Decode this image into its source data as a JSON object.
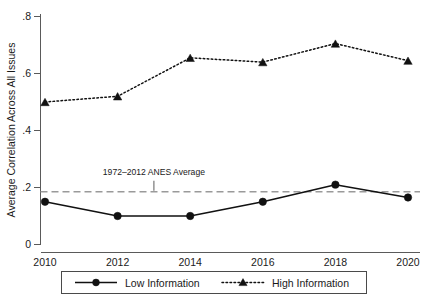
{
  "chart_data": {
    "type": "line",
    "title": "",
    "xlabel": "",
    "ylabel": "Average Correlation Across All Issues",
    "x": [
      2010,
      2012,
      2014,
      2016,
      2018,
      2020
    ],
    "xticklabels": [
      "2010",
      "2012",
      "2014",
      "2016",
      "2018",
      "2020"
    ],
    "xlim": [
      2009.5,
      2020.5
    ],
    "yticks": [
      0,
      0.2,
      0.4,
      0.6,
      0.8
    ],
    "yticklabels": [
      "0",
      ".2",
      ".4",
      ".6",
      ".8"
    ],
    "ylim": [
      0,
      0.8
    ],
    "grid": false,
    "legend_position": "bottom",
    "series": [
      {
        "name": "Low Information",
        "marker": "circle",
        "linestyle": "solid",
        "color": "#111111",
        "values": [
          0.15,
          0.1,
          0.1,
          0.15,
          0.21,
          0.165
        ]
      },
      {
        "name": "High Information",
        "marker": "triangle",
        "linestyle": "dotted",
        "color": "#111111",
        "values": [
          0.5,
          0.52,
          0.655,
          0.64,
          0.705,
          0.645
        ]
      }
    ],
    "reference_lines": [
      {
        "label": "1972–2012 ANES Average",
        "value": 0.185,
        "orientation": "horizontal",
        "linestyle": "dashed",
        "color": "#9a9a9a"
      }
    ],
    "annotations": [
      {
        "text": "1972–2012 ANES Average",
        "x": 2013.0,
        "y": 0.245
      }
    ]
  },
  "legend": {
    "entries": [
      {
        "label": "Low Information"
      },
      {
        "label": "High Information"
      }
    ]
  },
  "axes": {
    "y_title": "Average Correlation Across All Issues",
    "y_tick_labels": [
      "0",
      ".2",
      ".4",
      ".6",
      ".8"
    ],
    "x_tick_labels": [
      "2010",
      "2012",
      "2014",
      "2016",
      "2018",
      "2020"
    ]
  }
}
